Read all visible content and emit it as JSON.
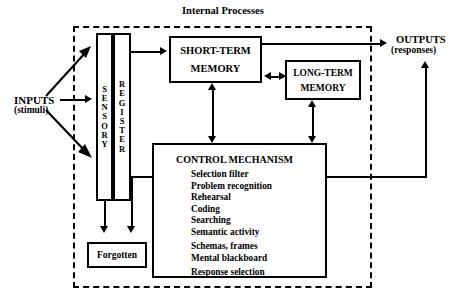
{
  "diagram": {
    "title": "Internal Processes",
    "inputs": {
      "line1": "INPUTS",
      "line2": "(stimuli)"
    },
    "outputs": {
      "line1": "OUTPUTS",
      "line2": "(responses)"
    },
    "sensory_register": {
      "sensory_label": "SENSORY",
      "register_label": "REGISTER",
      "sensory_letters": [
        "S",
        "E",
        "N",
        "S",
        "O",
        "R",
        "Y"
      ],
      "register_letters": [
        "R",
        "E",
        "G",
        "I",
        "S",
        "T",
        "E",
        "R"
      ]
    },
    "short_term_memory": {
      "line1": "SHORT-TERM",
      "line2": "MEMORY"
    },
    "long_term_memory": {
      "line1": "LONG-TERM",
      "line2": "MEMORY"
    },
    "forgotten": {
      "label": "Forgotten"
    },
    "control_mechanism": {
      "title": "CONTROL  MECHANISM",
      "items": [
        "Selection filter",
        "Problem recognition",
        "Rehearsal",
        "Coding",
        "Searching",
        "Semantic activity",
        "Schemas, frames",
        "Mental blackboard",
        "Response selection"
      ]
    },
    "colors": {
      "ink": "#000000",
      "paper": "#ffffff"
    }
  }
}
